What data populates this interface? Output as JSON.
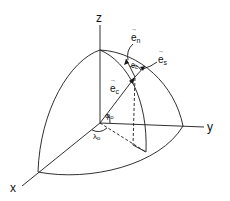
{
  "diagram": {
    "type": "3d-coordinate-sphere-octant",
    "axes": {
      "x": "x",
      "y": "y",
      "z": "z"
    },
    "vectors": {
      "e_n": {
        "base": "e",
        "sub": "n"
      },
      "e_s": {
        "base": "e",
        "sub": "s"
      },
      "e_c": {
        "base": "e",
        "sub": "c"
      }
    },
    "angles": {
      "phi": {
        "base": "φ",
        "sub": "o"
      },
      "lambda": {
        "base": "λ",
        "sub": "o"
      },
      "theta": {
        "base": "θ",
        "sub": "c"
      }
    },
    "colors": {
      "line": "#1a1a1a",
      "background": "#ffffff"
    }
  }
}
